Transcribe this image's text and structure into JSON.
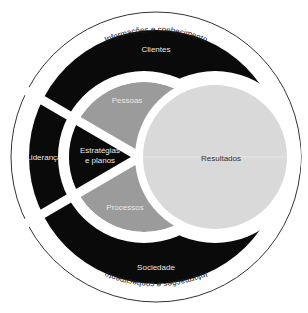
{
  "diagram": {
    "outer_ring": {
      "top_label": "Informações e conhecimento",
      "bottom_label": "Informações e conhecimento"
    },
    "black_band": {
      "top": "Clientes",
      "left": "Liderança",
      "bottom": "Sociedade"
    },
    "inner_disc": {
      "top": "Pessoas",
      "center": "Estratégias",
      "center_line2": "e planos",
      "bottom": "Processos"
    },
    "result_circle": {
      "label": "Resultados"
    },
    "colors": {
      "outer_line": "#333333",
      "band": "#0a0a0a",
      "inner_gray": "#9b9b9b",
      "result_fill": "#d9d9d9",
      "background": "#ffffff"
    }
  }
}
